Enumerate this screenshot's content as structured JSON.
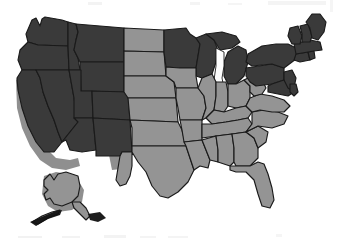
{
  "figure": {
    "background_color": "#ffffff",
    "width": 341,
    "height": 245
  },
  "legend": {
    "categories": [
      {
        "key": "dark",
        "label": "Dark shaded states",
        "color": "#3a3a3a"
      },
      {
        "key": "light",
        "label": "Light shaded states",
        "color": "#949494"
      }
    ],
    "border_color": "#1a1a1a",
    "lake_color": "#fdfdfd",
    "shadow_color": "#8f8f8f"
  },
  "map_data": {
    "type": "choropleth",
    "region": "United States",
    "shading_values": {
      "WA": "dark",
      "OR": "dark",
      "ID": "dark",
      "MT": "dark",
      "WY": "dark",
      "CA": "dark",
      "NV": "dark",
      "UT": "dark",
      "CO": "dark",
      "AZ": "dark",
      "NM": "dark",
      "ND": "light",
      "SD": "light",
      "NE": "light",
      "KS": "light",
      "OK": "light",
      "TX": "light",
      "MN": "dark",
      "IA": "light",
      "MO": "light",
      "AR": "light",
      "LA": "light",
      "WI": "dark",
      "MI": "dark",
      "IL": "light",
      "IN": "light",
      "OH": "light",
      "KY": "light",
      "TN": "light",
      "MS": "light",
      "AL": "light",
      "GA": "light",
      "FL": "light",
      "SC": "light",
      "NC": "light",
      "VA": "light",
      "WV": "light",
      "MD": "dark",
      "DE": "dark",
      "PA": "dark",
      "NJ": "dark",
      "NY": "dark",
      "CT": "dark",
      "RI": "dark",
      "MA": "dark",
      "VT": "dark",
      "NH": "dark",
      "ME": "dark",
      "AK": "light"
    },
    "insets": [
      {
        "key": "AK",
        "label": "Alaska",
        "shading": "light"
      }
    ],
    "water_features": [
      {
        "key": "great-lakes",
        "label": "Great Lakes"
      }
    ]
  }
}
